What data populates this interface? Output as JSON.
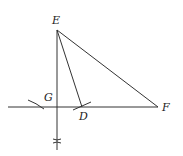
{
  "diagram": {
    "type": "geometric-construction",
    "labels": {
      "E": "E",
      "F": "F",
      "G": "G",
      "D": "D"
    },
    "points": {
      "E": [
        57,
        30
      ],
      "F": [
        158,
        107
      ],
      "G": [
        57,
        107
      ],
      "D": [
        82,
        107
      ]
    },
    "segments": [
      {
        "from": "E",
        "to": "F"
      },
      {
        "from": "E",
        "to": "D"
      },
      {
        "from": "E",
        "to": "G"
      }
    ],
    "lines": [
      {
        "name": "horizontal-line",
        "from": [
          8,
          107
        ],
        "to": [
          158,
          107
        ]
      },
      {
        "name": "perpendicular-line",
        "from": [
          57,
          30
        ],
        "to": [
          57,
          150
        ]
      }
    ],
    "construction_marks": [
      {
        "name": "arc-left",
        "near": [
          36,
          104
        ]
      },
      {
        "name": "arc-at-D",
        "near": [
          82,
          107
        ]
      },
      {
        "name": "arc-cross-below",
        "near": [
          57,
          141
        ]
      }
    ],
    "colors": {
      "stroke": "#333333",
      "background": "#ffffff"
    }
  }
}
